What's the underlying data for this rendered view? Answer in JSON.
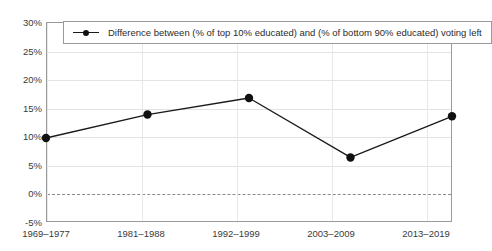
{
  "chart_data": {
    "type": "line",
    "title": "",
    "subtitle": "",
    "xlabel": "",
    "ylabel": "",
    "categories": [
      "1969–1977",
      "1981–1988",
      "1992–1999",
      "2003–2009",
      "2013–2019"
    ],
    "series": [
      {
        "name": "Difference between (% of top 10% educated) and (% of bottom 90% educated) voting left",
        "values": [
          9.7,
          13.8,
          16.7,
          6.3,
          13.5
        ]
      }
    ],
    "ylim": [
      -5,
      30
    ],
    "ytick_values": [
      30,
      25,
      20,
      15,
      10,
      5,
      0,
      -5
    ],
    "ytick_labels": [
      "30%",
      "25%",
      "20%",
      "15%",
      "10%",
      "5%",
      "0%",
      "-5%"
    ],
    "grid": true,
    "zero_line": true,
    "legend_position": "top-left-inside",
    "marker": "circle",
    "line_color": "#1a1a1a",
    "marker_color": "#111111",
    "grid_color": "#e3e3e3",
    "zero_line_color": "#8a8a8a",
    "frame_color": "#9a9a9a",
    "background_color": "#ffffff"
  },
  "legend": {
    "entries": [
      {
        "label": "Difference between (% of top 10% educated) and (% of bottom 90% educated) voting left"
      }
    ]
  }
}
